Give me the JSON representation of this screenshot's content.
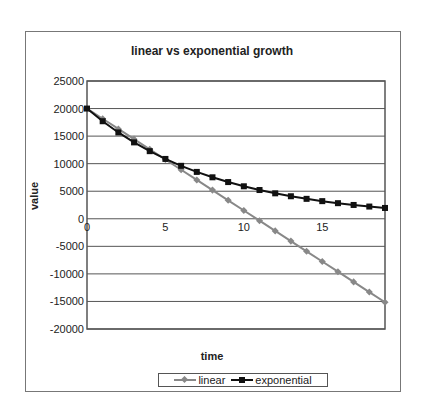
{
  "chart_data": {
    "type": "line",
    "title": "linear vs exponential growth",
    "xlabel": "time",
    "ylabel": "value",
    "x": [
      0,
      1,
      2,
      3,
      4,
      5,
      6,
      7,
      8,
      9,
      10,
      11,
      12,
      13,
      14,
      15,
      16,
      17,
      18,
      19
    ],
    "series": [
      {
        "name": "linear",
        "color": "#888888",
        "marker": "diamond",
        "values": [
          20000,
          18150,
          16300,
          14450,
          12600,
          10750,
          8900,
          7050,
          5200,
          3350,
          1500,
          -350,
          -2200,
          -4050,
          -5900,
          -7750,
          -9600,
          -11450,
          -13300,
          -15150
        ]
      },
      {
        "name": "exponential",
        "color": "#111111",
        "marker": "square",
        "values": [
          20000,
          17700,
          15665,
          13863,
          12269,
          10858,
          9610,
          8504,
          7526,
          6661,
          5895,
          5217,
          4617,
          4086,
          3616,
          3200,
          2832,
          2507,
          2218,
          1963
        ]
      }
    ],
    "xticks": [
      "0",
      "5",
      "10",
      "15"
    ],
    "yticks": [
      "25000",
      "20000",
      "15000",
      "10000",
      "5000",
      "0",
      "-5000",
      "-10000",
      "-15000",
      "-20000"
    ],
    "ylim": [
      -20000,
      25000
    ],
    "xlim": [
      0,
      19
    ],
    "grid": true,
    "legend_position": "bottom"
  },
  "legend": {
    "linear": "linear",
    "exponential": "exponential"
  }
}
